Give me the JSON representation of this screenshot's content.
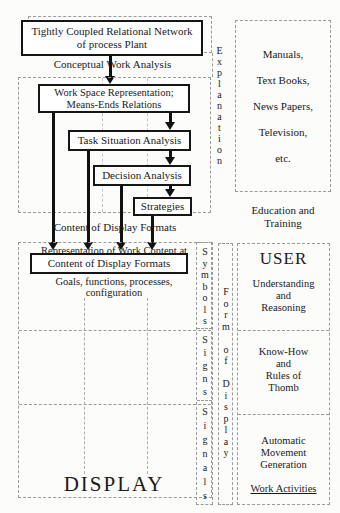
{
  "colors": {
    "ink": "#1a1a1a",
    "line_gray": "#9a9a9a",
    "background": "#fcfcfa"
  },
  "flow": {
    "top_box": {
      "line1": "Tightly Coupled Relational Network",
      "line2": "of process Plant"
    },
    "arrow1_label": "Conceptual Work Analysis",
    "work_space_box": {
      "line1": "Work Space Representation;",
      "line2": "Means-Ends Relations"
    },
    "task_box": "Task Situation Analysis",
    "decision_box": "Decision Analysis",
    "strategies_box": "Strategies",
    "output_label": "Content of Display Formats"
  },
  "display_section": {
    "overlapped_text": {
      "line1": "Representation of Work Content at",
      "line2": "Goals, functions, processes,",
      "line3": "configuration"
    },
    "content_box_label": "Content of Display Formats",
    "display_label": "DISPLAY"
  },
  "vertical_labels": {
    "explanation": "Explanation",
    "symbols": "Symbols",
    "signs": "Signs",
    "signals": "Signals",
    "form_of_display": "Form of Display"
  },
  "right_column": {
    "media_box": {
      "items": [
        "Manuals,",
        "Text Books,",
        "News Papers,",
        "Television,",
        "etc."
      ]
    },
    "education_label": {
      "line1": "Education and",
      "line2": "Training"
    },
    "user_box": {
      "title": "USER",
      "section1": {
        "line1": "Understanding",
        "line2": "and",
        "line3": "Reasoning"
      },
      "section2": {
        "line1": "Know-How",
        "line2": "and",
        "line3": "Rules of",
        "line4": "Thomb"
      },
      "section3": {
        "line1": "Automatic",
        "line2": "Movement",
        "line3": "Generation"
      },
      "work_activities": "Work Activities"
    }
  }
}
